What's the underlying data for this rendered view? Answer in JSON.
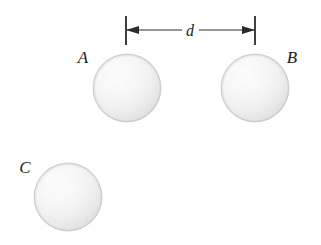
{
  "figure": {
    "background_color": "#ffffff",
    "width": 321,
    "height": 245,
    "ink_color": "#2a2a2a",
    "label_color": "#1b1b1b",
    "sphere_fill_light": "#fdfdfd",
    "sphere_fill_mid": "#f0f0f0",
    "sphere_fill_edge": "#d6d6d6",
    "sphere_outline": "#c9c9c9"
  },
  "spheres": [
    {
      "id": "A",
      "label": "A",
      "cx": 127,
      "cy": 88,
      "r": 34,
      "label_x": 83,
      "label_y": 63
    },
    {
      "id": "B",
      "label": "B",
      "cx": 255,
      "cy": 88,
      "r": 34,
      "label_x": 288,
      "label_y": 63
    },
    {
      "id": "C",
      "label": "C",
      "cx": 68,
      "cy": 197,
      "r": 34,
      "label_x": 22,
      "label_y": 173
    }
  ],
  "dimension": {
    "label": "d",
    "label_x": 190,
    "label_y": 36,
    "line_y": 30,
    "left_x": 126,
    "right_x": 255,
    "tick_top": 16,
    "tick_bottom": 45,
    "gap_left": 182,
    "gap_right": 199,
    "arrow_length": 11,
    "arrow_half_height": 4
  }
}
